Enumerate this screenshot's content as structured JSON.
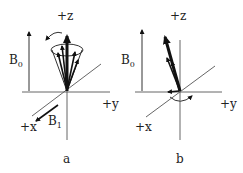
{
  "panels": [
    {
      "id": "a",
      "caption": "a",
      "labels": {
        "z": "+z",
        "y": "+y",
        "x": "+x",
        "b0_main": "B",
        "b0_sub": "0",
        "b1_main": "B",
        "b1_sub": "1"
      },
      "description": "Magnetization vectors precessing about +z (B0) on a cone; B1 field along +x"
    },
    {
      "id": "b",
      "caption": "b",
      "labels": {
        "z": "+z",
        "y": "+y",
        "x": "+x",
        "b0_main": "B",
        "b0_sub": "0"
      },
      "description": "Net magnetization tipped away from +z toward the x-y plane, rotating about z"
    }
  ],
  "colors": {
    "axis": "#555555",
    "vector": "#111111",
    "text": "#222222",
    "background": "#ffffff"
  }
}
